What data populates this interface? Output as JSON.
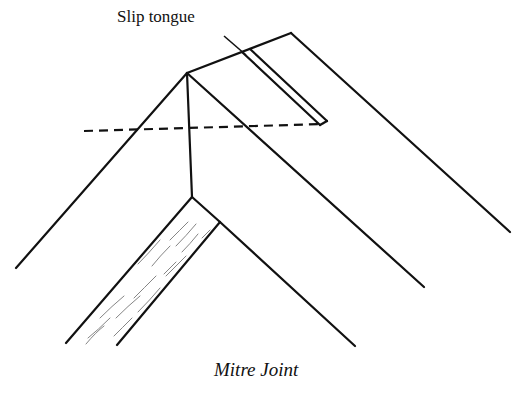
{
  "diagram": {
    "title": "Mitre Joint",
    "labels": {
      "slip_tongue": "Slip tongue"
    },
    "colors": {
      "line": "#111111",
      "grain": "#777777",
      "background": "#ffffff"
    }
  }
}
